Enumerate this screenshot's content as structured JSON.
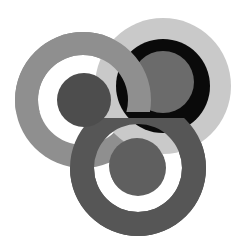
{
  "graphic": {
    "description": "Three interlocking target rings logo",
    "background": "#ffffff",
    "targets": [
      {
        "name": "left-target",
        "cx": 83,
        "cy": 100,
        "outer_r": 68,
        "ring_color": "#8f8f8f",
        "gap_r": 45,
        "gap_color": "#ffffff",
        "dot_r": 27,
        "dot_color": "#4d4d4d"
      },
      {
        "name": "top-right-target",
        "cx": 163,
        "cy": 86,
        "outer_r": 68,
        "ring_color": "#c9c9c9",
        "gap_r": 47,
        "gap_color": "#0a0a0a",
        "dot_r": 31,
        "dot_color": "#6b6b6b"
      },
      {
        "name": "bottom-target",
        "cx": 138,
        "cy": 168,
        "outer_r": 68,
        "ring_color": "#565656",
        "gap_r": 44,
        "gap_color": "#ffffff",
        "dot_r": 28,
        "dot_color": "#5f5f5f"
      }
    ]
  }
}
